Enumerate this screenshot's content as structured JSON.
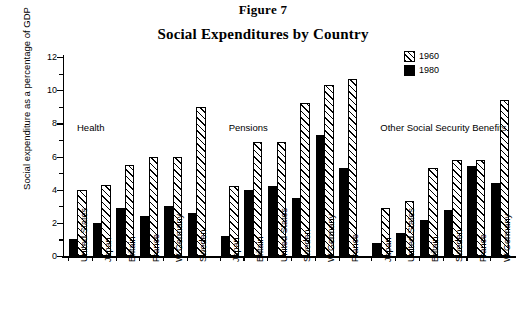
{
  "figure": {
    "label": "Figure 7",
    "title": "Social Expenditures by Country"
  },
  "legend": {
    "position": "top-right",
    "entries": [
      {
        "label": "1960",
        "pattern": "diagonal-hatch",
        "color": "#000000"
      },
      {
        "label": "1980",
        "pattern": "solid",
        "color": "#000000"
      }
    ]
  },
  "axes": {
    "ylabel": "Social expenditure as a percentage of GDP",
    "yticks": [
      0,
      2,
      4,
      6,
      8,
      10,
      12
    ],
    "ylim": [
      0,
      12
    ],
    "xlabel": ""
  },
  "chart_data": {
    "type": "bar",
    "title": "Social Expenditures by Country",
    "subtitle": "Figure 7",
    "xlabel": "",
    "ylabel": "Social expenditure as a percentage of GDP",
    "ylim": [
      0,
      12
    ],
    "yticks": [
      0,
      2,
      4,
      6,
      8,
      10,
      12
    ],
    "grid": false,
    "legend_position": "top-right",
    "series": [
      {
        "name": "1960",
        "pattern": "diagonal-hatch"
      },
      {
        "name": "1980",
        "pattern": "solid"
      }
    ],
    "groups": [
      {
        "name": "Health",
        "categories": [
          "United States",
          "Japan",
          "Britain",
          "France",
          "W Germany",
          "Sweden"
        ],
        "values_1960": [
          4.0,
          4.3,
          5.5,
          6.0,
          6.0,
          9.0
        ],
        "values_1980": [
          1.0,
          2.0,
          2.9,
          2.4,
          3.0,
          2.6
        ]
      },
      {
        "name": "Pensions",
        "categories": [
          "Japan",
          "Britain",
          "United States",
          "Sweden",
          "W Germany",
          "France"
        ],
        "values_1960": [
          4.2,
          6.9,
          6.9,
          9.2,
          10.3,
          10.7
        ],
        "values_1980": [
          1.2,
          4.0,
          4.2,
          3.5,
          7.3,
          5.3
        ]
      },
      {
        "name": "Other Social Security Benefits",
        "categories": [
          "Japan",
          "United States",
          "Britain",
          "Sweden",
          "France",
          "W Germany"
        ],
        "values_1960": [
          2.9,
          3.3,
          5.3,
          5.8,
          5.8,
          9.4
        ],
        "values_1980": [
          0.8,
          1.4,
          2.2,
          2.8,
          5.4,
          4.4
        ]
      }
    ]
  }
}
